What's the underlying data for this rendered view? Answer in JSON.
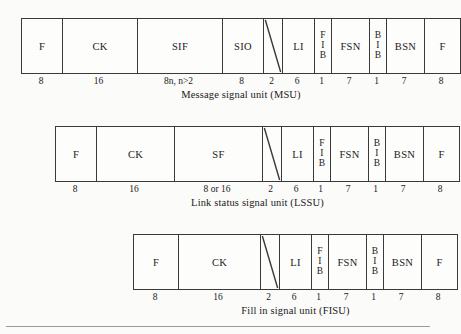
{
  "document": {
    "type": "signal-unit-format-diagram",
    "background_color": "#fbfbf9",
    "line_color": "#3a3a3a"
  },
  "figures": [
    {
      "id": "msu",
      "caption": "Message signal unit (MSU)",
      "fields": [
        {
          "label": "F",
          "bits": "8",
          "kind": "text",
          "width": 40
        },
        {
          "label": "CK",
          "bits": "16",
          "kind": "text",
          "width": 75
        },
        {
          "label": "SIF",
          "bits": "8n, n>2",
          "kind": "text",
          "width": 85
        },
        {
          "label": "SIO",
          "bits": "8",
          "kind": "text",
          "width": 41
        },
        {
          "label": "",
          "bits": "2",
          "kind": "diagonal",
          "width": 19
        },
        {
          "label": "LI",
          "bits": "6",
          "kind": "text",
          "width": 32
        },
        {
          "label": "F I B",
          "bits": "1",
          "kind": "stacked",
          "width": 17,
          "letters": [
            "F",
            "I",
            "B"
          ]
        },
        {
          "label": "FSN",
          "bits": "7",
          "kind": "text",
          "width": 38
        },
        {
          "label": "B I B",
          "bits": "1",
          "kind": "stacked",
          "width": 17,
          "letters": [
            "B",
            "I",
            "B"
          ]
        },
        {
          "label": "BSN",
          "bits": "7",
          "kind": "text",
          "width": 38
        },
        {
          "label": "F",
          "bits": "8",
          "kind": "text",
          "width": 36
        }
      ]
    },
    {
      "id": "lssu",
      "caption": "Link status signal unit (LSSU)",
      "fields": [
        {
          "label": "F",
          "bits": "8",
          "kind": "text",
          "width": 40
        },
        {
          "label": "CK",
          "bits": "16",
          "kind": "text",
          "width": 78
        },
        {
          "label": "SF",
          "bits": "8 or 16",
          "kind": "text",
          "width": 88
        },
        {
          "label": "",
          "bits": "2",
          "kind": "diagonal",
          "width": 19
        },
        {
          "label": "LI",
          "bits": "6",
          "kind": "text",
          "width": 32
        },
        {
          "label": "F I B",
          "bits": "1",
          "kind": "stacked",
          "width": 17,
          "letters": [
            "F",
            "I",
            "B"
          ]
        },
        {
          "label": "FSN",
          "bits": "7",
          "kind": "text",
          "width": 38
        },
        {
          "label": "B I B",
          "bits": "1",
          "kind": "stacked",
          "width": 17,
          "letters": [
            "B",
            "I",
            "B"
          ]
        },
        {
          "label": "BSN",
          "bits": "7",
          "kind": "text",
          "width": 38
        },
        {
          "label": "F",
          "bits": "8",
          "kind": "text",
          "width": 36
        }
      ]
    },
    {
      "id": "fisu",
      "caption": "Fill in signal unit (FISU)",
      "fields": [
        {
          "label": "F",
          "bits": "8",
          "kind": "text",
          "width": 44
        },
        {
          "label": "CK",
          "bits": "16",
          "kind": "text",
          "width": 82
        },
        {
          "label": "",
          "bits": "2",
          "kind": "diagonal",
          "width": 19
        },
        {
          "label": "LI",
          "bits": "6",
          "kind": "text",
          "width": 32
        },
        {
          "label": "F I B",
          "bits": "1",
          "kind": "stacked",
          "width": 17,
          "letters": [
            "F",
            "I",
            "B"
          ]
        },
        {
          "label": "FSN",
          "bits": "7",
          "kind": "text",
          "width": 38
        },
        {
          "label": "B I B",
          "bits": "1",
          "kind": "stacked",
          "width": 17,
          "letters": [
            "B",
            "I",
            "B"
          ]
        },
        {
          "label": "BSN",
          "bits": "7",
          "kind": "text",
          "width": 38
        },
        {
          "label": "F",
          "bits": "8",
          "kind": "text",
          "width": 36
        }
      ]
    }
  ]
}
